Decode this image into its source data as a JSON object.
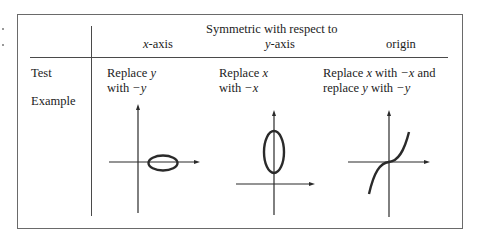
{
  "table": {
    "header": {
      "group_title": "Symmetric with respect to",
      "columns": [
        {
          "var": "x",
          "suffix": "-axis"
        },
        {
          "var": "y",
          "suffix": "-axis"
        },
        {
          "label": "origin"
        }
      ]
    },
    "rows": {
      "test": {
        "label": "Test",
        "cells": [
          {
            "line1": [
              "Replace ",
              "y"
            ],
            "line2": [
              "with ",
              "−y"
            ]
          },
          {
            "line1": [
              "Replace ",
              "x"
            ],
            "line2": [
              "with ",
              "−x"
            ]
          },
          {
            "line1": [
              "Replace ",
              "x",
              " with ",
              "−x",
              " and"
            ],
            "line2": [
              "replace ",
              "y",
              " with ",
              "−y"
            ]
          }
        ]
      },
      "example": {
        "label": "Example",
        "graphs": [
          {
            "name": "x-axis-symmetric-ellipse",
            "shape": "horizontal ellipse centered on x-axis, right of y-axis"
          },
          {
            "name": "y-axis-symmetric-ellipse",
            "shape": "vertical ellipse centered on y-axis, above x-axis"
          },
          {
            "name": "origin-symmetric-cubic",
            "shape": "cubic curve through origin"
          }
        ]
      }
    }
  },
  "colors": {
    "line": "#4a4a4a",
    "border": "#6a6a6a",
    "text": "#1c1c1c"
  }
}
